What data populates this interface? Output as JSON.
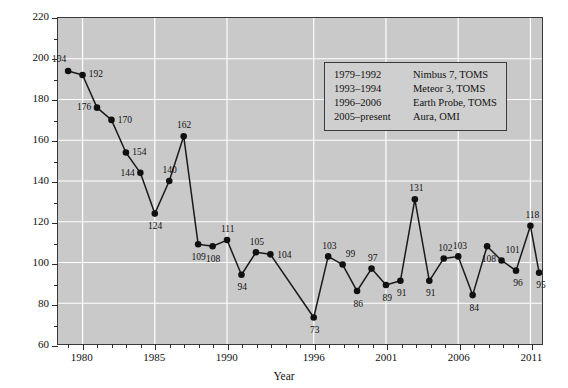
{
  "chart_data": {
    "type": "line",
    "title": "",
    "xlabel": "Year",
    "ylabel": "Minimum ozone (DU)",
    "xlim": [
      1978.3,
      2011.8
    ],
    "ylim": [
      60,
      220
    ],
    "ytick_step": 20,
    "yticks": [
      60,
      80,
      100,
      120,
      140,
      160,
      180,
      200,
      220
    ],
    "xticks": [
      1980,
      1985,
      1990,
      1996,
      2001,
      2006,
      2011
    ],
    "xtick_labels": [
      "1980",
      "1985",
      "1990",
      "1996",
      "2001",
      "2006",
      "2011"
    ],
    "grid": true,
    "grid_color": "#ffffff",
    "plot_bgcolor": "#c9c9c9",
    "line_color": "#1a1a1a",
    "marker_color": "#101010",
    "marker": "circle",
    "legend_position": "upper-center",
    "x": [
      1979,
      1980,
      1981,
      1982,
      1983,
      1984,
      1985,
      1986,
      1987,
      1988,
      1989,
      1990,
      1991,
      1992,
      1993,
      1996,
      1997,
      1998,
      1999,
      2000,
      2001,
      2002,
      2003,
      2004,
      2005,
      2006,
      2007,
      2008,
      2009,
      2010,
      2011
    ],
    "values": [
      194,
      192,
      176,
      170,
      154,
      144,
      124,
      140,
      162,
      109,
      108,
      111,
      94,
      105,
      104,
      73,
      103,
      99,
      86,
      97,
      89,
      91,
      131,
      91,
      102,
      103,
      84,
      108,
      101,
      96,
      118
    ],
    "point_labels": [
      "194",
      "192",
      "176",
      "170",
      "154",
      "144",
      "124",
      "140",
      "162",
      "109",
      "108",
      "111",
      "94",
      "105",
      "104",
      "73",
      "103",
      "99",
      "86",
      "97",
      "89",
      "91",
      "131",
      "91",
      "102",
      "103",
      "84",
      "108",
      "101",
      "96",
      "118"
    ],
    "gap_years": [
      1994,
      1995
    ],
    "series": [
      {
        "name": "Minimum ozone",
        "x": [
          1979,
          1980,
          1981,
          1982,
          1983,
          1984,
          1985,
          1986,
          1987,
          1988,
          1989,
          1990,
          1991,
          1992,
          1993,
          1996,
          1997,
          1998,
          1999,
          2000,
          2001,
          2002,
          2003,
          2004,
          2005,
          2006,
          2007,
          2008,
          2009,
          2010,
          2011
        ],
        "values": [
          194,
          192,
          176,
          170,
          154,
          144,
          124,
          140,
          162,
          109,
          108,
          111,
          94,
          105,
          104,
          73,
          103,
          99,
          86,
          97,
          89,
          91,
          131,
          91,
          102,
          103,
          84,
          108,
          101,
          96,
          118
        ]
      }
    ],
    "extra_points": [
      {
        "x": 2011.6,
        "y": 95,
        "label": "95"
      }
    ],
    "label_offsets": {
      "194": "above-left",
      "192": "right",
      "176": "left",
      "170": "right",
      "154": "right",
      "144": "left",
      "124": "below",
      "140": "above",
      "162": "above",
      "109": "below",
      "108": "below",
      "111": "above",
      "94": "below",
      "105": "above",
      "104": "right",
      "73": "below",
      "103": "above",
      "99": "above-right",
      "86": "below",
      "97": "above",
      "89": "below",
      "91": "below",
      "131": "above",
      "102": "above",
      "84": "below",
      "101": "above-right",
      "96": "below",
      "118": "above",
      "95": "below"
    },
    "annotations": []
  },
  "legend": {
    "rows": [
      {
        "period": "1979–1992",
        "instrument": "Nimbus 7, TOMS"
      },
      {
        "period": "1993–1994",
        "instrument": "Meteor 3, TOMS"
      },
      {
        "period": "1996–2006",
        "instrument": "Earth Probe, TOMS"
      },
      {
        "period": "2005–present",
        "instrument": "Aura, OMI"
      }
    ]
  }
}
